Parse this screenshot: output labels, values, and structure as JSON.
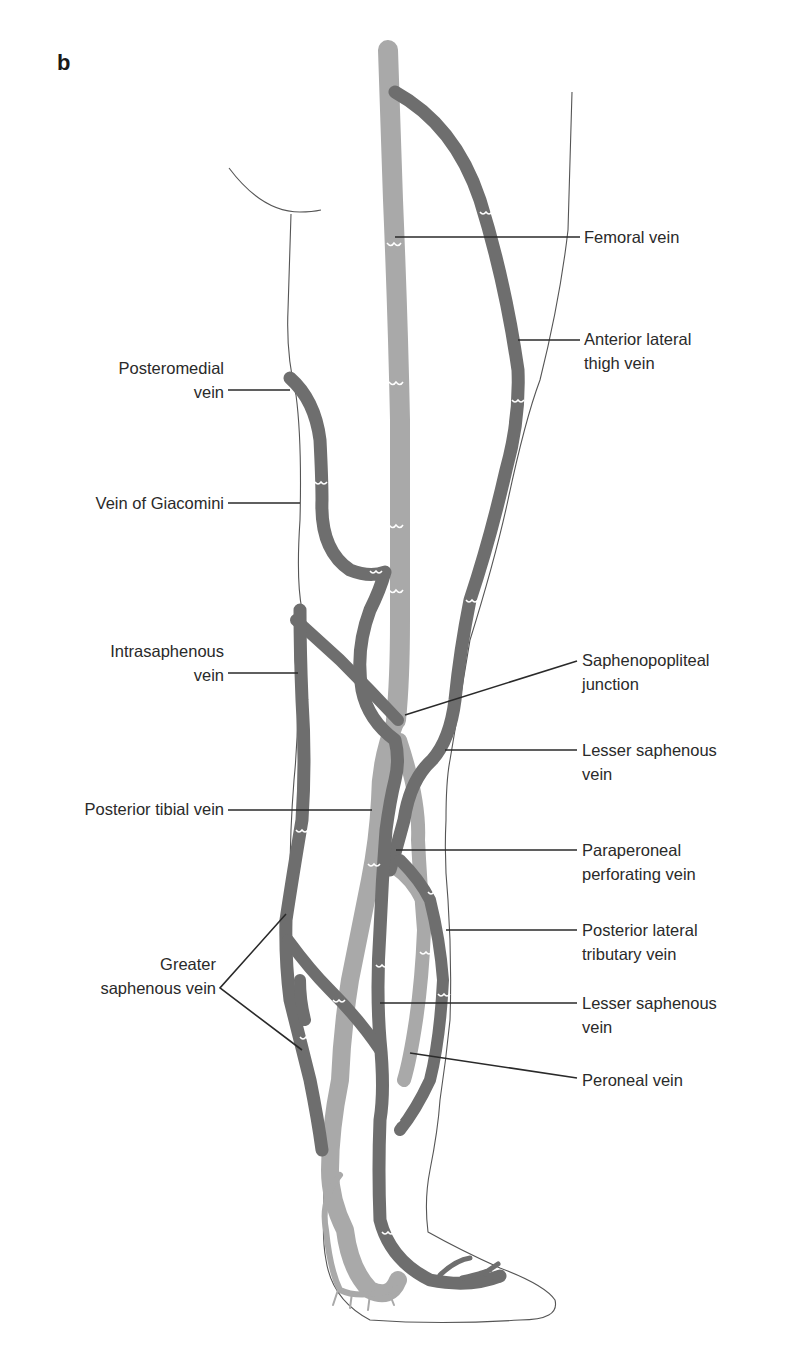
{
  "figure": {
    "panel_letter": "b",
    "colors": {
      "deep_vein": "#a9a9a9",
      "superficial_vein": "#6e6e6e",
      "outline": "#555555",
      "text": "#2a2a2a",
      "background": "#ffffff"
    }
  },
  "labels": {
    "left": [
      {
        "id": "posteromedial",
        "lines": [
          "Posteromedial",
          "vein"
        ]
      },
      {
        "id": "giacomini",
        "lines": [
          "Vein of Giacomini"
        ]
      },
      {
        "id": "intrasaphenous",
        "lines": [
          "Intrasaphenous",
          "vein"
        ]
      },
      {
        "id": "posterior-tibial",
        "lines": [
          "Posterior tibial vein"
        ]
      },
      {
        "id": "greater-saphenous",
        "lines": [
          "Greater",
          "saphenous vein"
        ]
      }
    ],
    "right": [
      {
        "id": "femoral",
        "lines": [
          "Femoral vein"
        ]
      },
      {
        "id": "anterior-lateral-thigh",
        "lines": [
          "Anterior lateral",
          "thigh vein"
        ]
      },
      {
        "id": "saphenopopliteal",
        "lines": [
          "Saphenopopliteal",
          "junction"
        ]
      },
      {
        "id": "lesser-saphenous-upper",
        "lines": [
          "Lesser saphenous",
          "vein"
        ]
      },
      {
        "id": "paraperoneal",
        "lines": [
          "Paraperoneal",
          "perforating vein"
        ]
      },
      {
        "id": "posterior-lateral-tributary",
        "lines": [
          "Posterior lateral",
          "tributary vein"
        ]
      },
      {
        "id": "lesser-saphenous-lower",
        "lines": [
          "Lesser saphenous",
          "vein"
        ]
      },
      {
        "id": "peroneal",
        "lines": [
          "Peroneal vein"
        ]
      }
    ]
  }
}
